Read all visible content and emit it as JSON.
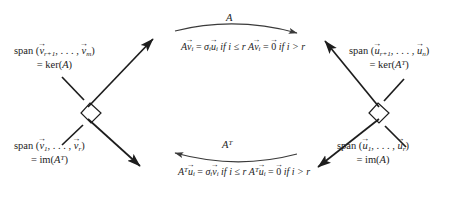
{
  "figure": {
    "type": "svd-four-subspaces-diagram",
    "title": "",
    "ink_color": "#1d1d1d",
    "background_color": "#ffffff"
  },
  "labels": {
    "top_left": {
      "line1_prefix": "span (",
      "line1_vec1": "v",
      "line1_sub1": "r+1",
      "line1_sep": ", . . . , ",
      "line1_vec2": "v",
      "line1_sub2": "m",
      "line1_suffix": ")",
      "line2_eq": "= ker(",
      "line2_mat": "A",
      "line2_close": ")",
      "plain": "span (v_{r+1}, ..., v_m) = ker(A)"
    },
    "bottom_left": {
      "line1_prefix": "span (",
      "line1_vec1": "v",
      "line1_sub1": "1",
      "line1_sep": ", . . . , ",
      "line1_vec2": "v",
      "line1_sub2": "r",
      "line1_suffix": ")",
      "line2_eq": "= im(",
      "line2_mat": "A",
      "line2_sup": "T",
      "line2_close": ")",
      "plain": "span (v_1, ..., v_r) = im(A^T)"
    },
    "top_right": {
      "line1_prefix": "span (",
      "line1_vec1": "u",
      "line1_sub1": "r+1",
      "line1_sep": ", . . . , ",
      "line1_vec2": "u",
      "line1_sub2": "n",
      "line1_suffix": ")",
      "line2_eq": "= ker(",
      "line2_mat": "A",
      "line2_sup": "T",
      "line2_close": ")",
      "plain": "span (u_{r+1}, ..., u_n) = ker(A^T)"
    },
    "bottom_right": {
      "line1_prefix": "span (",
      "line1_vec1": "u",
      "line1_sub1": "1",
      "line1_sep": ", . . . , ",
      "line1_vec2": "u",
      "line1_sub2": "r",
      "line1_suffix": ")",
      "line2_eq": "= im(",
      "line2_mat": "A",
      "line2_close": ")",
      "plain": "span (u_1, ..., u_r) = im(A)"
    }
  },
  "maps": {
    "forward": {
      "label": "A",
      "direction": "left-to-right",
      "eq_line1": {
        "mat": "A",
        "vec": "v",
        "vec_sub": "i",
        "equals": "=",
        "sigma": "σ",
        "sigma_sub": "i",
        "rhs_vec": "u",
        "rhs_sub": "i",
        "cond": "if i ≤ r",
        "plain": "A v_i = σ_i u_i if i ≤ r"
      },
      "eq_line2": {
        "mat": "A",
        "vec": "v",
        "vec_sub": "i",
        "equals": "=",
        "zero": "0",
        "cond": "if i > r",
        "plain": "A v_i = 0 if i > r"
      }
    },
    "backward": {
      "label": "A",
      "label_sup": "T",
      "direction": "right-to-left",
      "eq_line1": {
        "mat": "A",
        "mat_sup": "T",
        "vec": "u",
        "vec_sub": "i",
        "equals": "=",
        "sigma": "σ",
        "sigma_sub": "i",
        "rhs_vec": "v",
        "rhs_sub": "i",
        "cond": "if i ≤ r",
        "plain": "A^T u_i = σ_i v_i if i ≤ r"
      },
      "eq_line2": {
        "mat": "A",
        "mat_sup": "T",
        "vec": "u",
        "vec_sub": "i",
        "equals": "=",
        "zero": "0",
        "cond": "if i > r",
        "plain": "A^T u_i = 0 if i > r"
      }
    }
  },
  "vector_accent": "→",
  "axes": {
    "left_cross": {
      "name": "domain-axes",
      "right_angle_marker": true,
      "arm_up_right": "arrow",
      "arm_down_right": "arrow"
    },
    "right_cross": {
      "name": "codomain-axes",
      "right_angle_marker": true,
      "arm_up_left": "arrow",
      "arm_down_left": "arrow"
    }
  }
}
